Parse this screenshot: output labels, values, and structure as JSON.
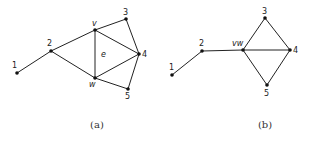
{
  "graphs": [
    {
      "caption": "(a)",
      "nodes": [
        {
          "id": "1",
          "label": "1",
          "x": 17,
          "y": 73,
          "lx": 12,
          "ly": 68
        },
        {
          "id": "2",
          "label": "2",
          "x": 51,
          "y": 51,
          "lx": 47,
          "ly": 46
        },
        {
          "id": "v",
          "label": "v",
          "x": 95,
          "y": 30,
          "lx": 92,
          "ly": 26,
          "italic": true
        },
        {
          "id": "3",
          "label": "3",
          "x": 126,
          "y": 19,
          "lx": 123,
          "ly": 15
        },
        {
          "id": "4",
          "label": "4",
          "x": 139,
          "y": 54,
          "lx": 142,
          "ly": 57
        },
        {
          "id": "w",
          "label": "w",
          "x": 95,
          "y": 78,
          "lx": 89,
          "ly": 87,
          "italic": true
        },
        {
          "id": "5",
          "label": "5",
          "x": 128,
          "y": 89,
          "lx": 125,
          "ly": 99
        }
      ],
      "edges": [
        [
          "1",
          "2"
        ],
        [
          "2",
          "v"
        ],
        [
          "2",
          "w"
        ],
        [
          "v",
          "3"
        ],
        [
          "v",
          "4"
        ],
        [
          "v",
          "w"
        ],
        [
          "3",
          "4"
        ],
        [
          "w",
          "4"
        ],
        [
          "w",
          "5"
        ],
        [
          "5",
          "4"
        ]
      ],
      "edge_labels": [
        {
          "label": "e",
          "x": 101,
          "y": 57
        }
      ],
      "caption_pos": {
        "x": 97,
        "y": 128
      }
    },
    {
      "caption": "(b)",
      "nodes": [
        {
          "id": "1",
          "label": "1",
          "x": 172,
          "y": 75,
          "lx": 169,
          "ly": 70
        },
        {
          "id": "2",
          "label": "2",
          "x": 202,
          "y": 51,
          "lx": 199,
          "ly": 46
        },
        {
          "id": "vw",
          "label": "vw",
          "x": 243,
          "y": 50,
          "lx": 232,
          "ly": 46,
          "italic": true
        },
        {
          "id": "3",
          "label": "3",
          "x": 265,
          "y": 18,
          "lx": 262,
          "ly": 14
        },
        {
          "id": "4",
          "label": "4",
          "x": 290,
          "y": 50,
          "lx": 293,
          "ly": 53
        },
        {
          "id": "5",
          "label": "5",
          "x": 267,
          "y": 85,
          "lx": 264,
          "ly": 96
        }
      ],
      "edges": [
        [
          "1",
          "2"
        ],
        [
          "2",
          "vw"
        ],
        [
          "vw",
          "3"
        ],
        [
          "vw",
          "4"
        ],
        [
          "vw",
          "5"
        ],
        [
          "3",
          "4"
        ],
        [
          "5",
          "4"
        ]
      ],
      "edge_labels": [],
      "caption_pos": {
        "x": 265,
        "y": 128
      }
    }
  ]
}
